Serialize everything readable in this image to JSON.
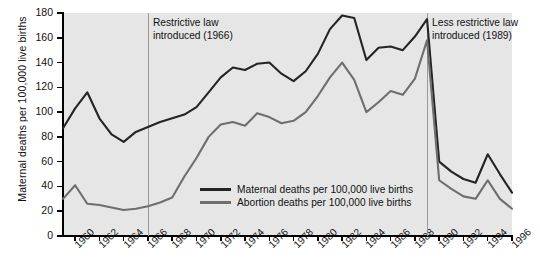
{
  "chart_data": {
    "type": "line",
    "title": "",
    "xlabel": "",
    "ylabel": "Maternal deaths per 100,000 live births",
    "ylim": [
      0,
      180
    ],
    "xlim": [
      1959,
      1996
    ],
    "ytick_labels": [
      "0",
      "20",
      "40",
      "60",
      "80",
      "100",
      "120",
      "140",
      "160",
      "180"
    ],
    "ytick_values": [
      0,
      20,
      40,
      60,
      80,
      100,
      120,
      140,
      160,
      180
    ],
    "xtick_labels": [
      "1960",
      "1962",
      "1964",
      "1966",
      "1968",
      "1970",
      "1972",
      "1974",
      "1976",
      "1978",
      "1980",
      "1982",
      "1984",
      "1986",
      "1988",
      "1990",
      "1992",
      "1994",
      "1996"
    ],
    "xtick_values": [
      1960,
      1962,
      1964,
      1966,
      1968,
      1970,
      1972,
      1974,
      1976,
      1978,
      1980,
      1982,
      1984,
      1986,
      1988,
      1990,
      1992,
      1994,
      1996
    ],
    "grid": false,
    "legend_position": "inside-lower-center",
    "plot_background": "#e6e6e6",
    "x": [
      1959,
      1960,
      1961,
      1962,
      1963,
      1964,
      1965,
      1966,
      1967,
      1968,
      1969,
      1970,
      1971,
      1972,
      1973,
      1974,
      1975,
      1976,
      1977,
      1978,
      1979,
      1980,
      1981,
      1982,
      1983,
      1984,
      1985,
      1986,
      1987,
      1988,
      1989,
      1990,
      1991,
      1992,
      1993,
      1994,
      1995,
      1996
    ],
    "series": [
      {
        "name": "Maternal deaths per 100,000 live births",
        "color": "#242424",
        "values": [
          87,
          103,
          116,
          95,
          82,
          76,
          84,
          88,
          92,
          95,
          98,
          104,
          116,
          128,
          136,
          134,
          139,
          140,
          131,
          125,
          133,
          147,
          167,
          178,
          176,
          142,
          152,
          153,
          150,
          161,
          175,
          60,
          52,
          46,
          43,
          66,
          50,
          35
        ]
      },
      {
        "name": "Abortion deaths per 100,000 live births",
        "color": "#6e6e6e",
        "values": [
          30,
          41,
          26,
          25,
          23,
          21,
          22,
          24,
          27,
          31,
          48,
          63,
          80,
          90,
          92,
          89,
          99,
          96,
          91,
          93,
          100,
          113,
          128,
          140,
          126,
          100,
          108,
          117,
          114,
          127,
          158,
          45,
          38,
          32,
          30,
          45,
          30,
          22
        ]
      }
    ],
    "annotations": [
      {
        "text_line1": "Restrictive law",
        "text_line2": "introduced (1966)",
        "x_year": 1966
      },
      {
        "text_line1": "Less restrictive law",
        "text_line2": "introduced (1989)",
        "x_year": 1989
      }
    ]
  },
  "legend": {
    "items": [
      {
        "label": "Maternal deaths per 100,000 live births",
        "color": "#242424"
      },
      {
        "label": "Abortion deaths per 100,000 live births",
        "color": "#6e6e6e"
      }
    ]
  },
  "caption": {
    "text": ""
  }
}
